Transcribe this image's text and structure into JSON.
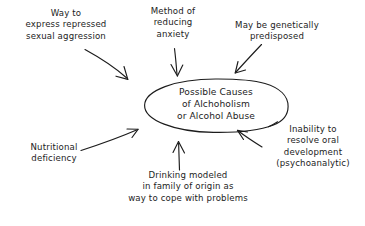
{
  "diagram": {
    "type": "concept-map",
    "style": "hand-drawn",
    "ink_color": "#1c1c1c",
    "background_color": "#ffffff",
    "center": {
      "shape": "ellipse",
      "text": "Possible Causes\nof Alchoholism\nor Alcohol Abuse",
      "lines": [
        "Possible Causes",
        "of Alchoholism",
        "or Alcohol Abuse"
      ]
    },
    "nodes": [
      {
        "id": "aggression",
        "text": "Way to\nexpress repressed\nsexual aggression",
        "lines": [
          "Way to",
          "express repressed",
          "sexual aggression"
        ],
        "position": "top-left",
        "arrow": "points down-right into ellipse"
      },
      {
        "id": "anxiety",
        "text": "Method of\nreducing\nanxiety",
        "lines": [
          "Method of",
          "reducing",
          "anxiety"
        ],
        "position": "top-center",
        "arrow": "points straight down into ellipse"
      },
      {
        "id": "genetic",
        "text": "May be genetically\npredisposed",
        "lines": [
          "May be genetically",
          "predisposed"
        ],
        "position": "top-right",
        "arrow": "points down-left into ellipse"
      },
      {
        "id": "nutrition",
        "text": "Nutritional\ndeficiency",
        "lines": [
          "Nutritional",
          "deficiency"
        ],
        "position": "bottom-left",
        "arrow": "points up-right into ellipse"
      },
      {
        "id": "modeled",
        "text": "Drinking modeled\nin family of origin as\nway to cope with problems",
        "lines": [
          "Drinking modeled",
          "in family of origin as",
          "way to cope with problems"
        ],
        "position": "bottom-center",
        "arrow": "points straight up into ellipse"
      },
      {
        "id": "oral",
        "text": "Inability to\nresolve oral\ndevelopment\n(psychoanalytic)",
        "lines": [
          "Inability to",
          "resolve oral",
          "development",
          "(psychoanalytic)"
        ],
        "position": "bottom-right",
        "arrow": "points up-left into ellipse"
      }
    ]
  }
}
